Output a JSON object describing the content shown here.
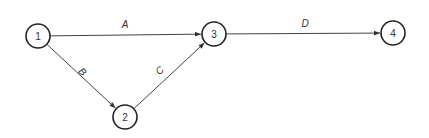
{
  "diagram": {
    "type": "activity-on-arrow network",
    "nodes": [
      {
        "id": "1",
        "label": "1",
        "x": 38,
        "y": 36
      },
      {
        "id": "2",
        "label": "2",
        "x": 125,
        "y": 117
      },
      {
        "id": "3",
        "label": "3",
        "x": 214,
        "y": 34
      },
      {
        "id": "4",
        "label": "4",
        "x": 393,
        "y": 33
      }
    ],
    "edges": [
      {
        "id": "A",
        "label": "A",
        "from": "1",
        "to": "3",
        "label_x": 125,
        "label_y": 28,
        "label_rotate": 0
      },
      {
        "id": "B",
        "label": "B",
        "from": "1",
        "to": "2",
        "label_x": 80,
        "label_y": 74,
        "label_rotate": 45
      },
      {
        "id": "C",
        "label": "C",
        "from": "2",
        "to": "3",
        "label_x": 162,
        "label_y": 73,
        "label_rotate": -45
      },
      {
        "id": "D",
        "label": "D",
        "from": "3",
        "to": "4",
        "label_x": 305,
        "label_y": 27,
        "label_rotate": 0
      }
    ],
    "colors": {
      "stroke": "#222222",
      "edge": "#444444",
      "text": "#333333",
      "background": "#ffffff"
    }
  }
}
